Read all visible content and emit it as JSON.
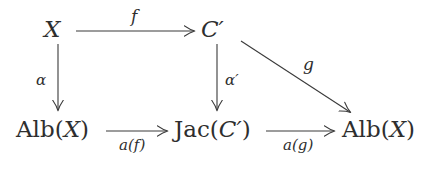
{
  "diagram": {
    "kind": "commutative-diagram",
    "background_color": "#ffffff",
    "ink_color": "#2e2e2e",
    "nodes": [
      {
        "id": "top-left",
        "label": "X",
        "upright": "",
        "italic": "X",
        "prime": "",
        "x": 44,
        "y": 18
      },
      {
        "id": "top-middle",
        "label": "C′",
        "upright": "",
        "italic": "C",
        "prime": "′",
        "x": 203,
        "y": 18
      },
      {
        "id": "bottom-left",
        "label": "Alb(X)",
        "upright": "Alb",
        "italic": "X",
        "prime": "",
        "x": 16,
        "y": 118
      },
      {
        "id": "bottom-middle",
        "label": "Jac(C′)",
        "upright": "Jac",
        "italic": "C",
        "prime": "′",
        "x": 174,
        "y": 118
      },
      {
        "id": "bottom-right",
        "label": "Alb(X)",
        "upright": "Alb",
        "italic": "X",
        "prime": "",
        "x": 342,
        "y": 118
      }
    ],
    "arrows": [
      {
        "id": "f",
        "from": "top-left",
        "to": "top-middle",
        "label": "f",
        "label_pos": "above"
      },
      {
        "id": "alpha",
        "from": "top-left",
        "to": "bottom-left",
        "label": "α",
        "label_pos": "left"
      },
      {
        "id": "alpha-prime",
        "from": "top-middle",
        "to": "bottom-middle",
        "label": "α′",
        "label_pos": "right"
      },
      {
        "id": "g",
        "from": "top-middle",
        "to": "bottom-right",
        "label": "g",
        "label_pos": "above-right"
      },
      {
        "id": "a-f",
        "from": "bottom-left",
        "to": "bottom-middle",
        "label": "a(f)",
        "label_pos": "below"
      },
      {
        "id": "a-g",
        "from": "bottom-middle",
        "to": "bottom-right",
        "label": "a(g)",
        "label_pos": "below"
      }
    ],
    "labels": {
      "f": "f",
      "g": "g",
      "alpha": "α",
      "alpha_prime_base": "α",
      "alpha_prime_mark": "′",
      "a_of_f_fn": "a",
      "a_of_f_arg": "f",
      "a_of_g_fn": "a",
      "a_of_g_arg": "g",
      "paren_open": "(",
      "paren_close": ")",
      "alb": "Alb",
      "jac": "Jac",
      "X": "X",
      "C": "C",
      "prime": "′"
    }
  }
}
